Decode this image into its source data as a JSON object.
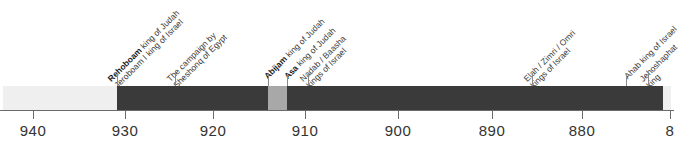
{
  "chart_data": {
    "type": "bar",
    "title": "",
    "subtitle": "",
    "xlabel": "",
    "ylabel": "",
    "orientation": "horizontal",
    "axis": {
      "units": "BCE years",
      "direction": "descending",
      "xlim": [
        945,
        876
      ],
      "grid": false,
      "ticks": [
        {
          "label": "940",
          "value": 940,
          "x": 33
        },
        {
          "label": "930",
          "value": 930,
          "x": 125
        },
        {
          "label": "920",
          "value": 920,
          "x": 213
        },
        {
          "label": "910",
          "value": 910,
          "x": 305
        },
        {
          "label": "900",
          "value": 900,
          "x": 398
        },
        {
          "label": "890",
          "value": 890,
          "x": 492
        },
        {
          "label": "880",
          "value": 880,
          "x": 582
        },
        {
          "label": "8",
          "value": 870,
          "x": 670,
          "clipped": true
        }
      ]
    },
    "segments": [
      {
        "name": "segment-pre-rehoboam",
        "color": "#efefef",
        "x": 3,
        "width": 114
      },
      {
        "name": "segment-rehoboam",
        "color": "#3a3a3a",
        "x": 117,
        "width": 151
      },
      {
        "name": "segment-abijam",
        "color": "#a8a8a8",
        "x": 268,
        "width": 19
      },
      {
        "name": "segment-asa",
        "color": "#3a3a3a",
        "x": 287,
        "width": 376
      },
      {
        "name": "segment-post-asa",
        "color": "#efefef",
        "x": 663,
        "width": 8
      }
    ],
    "annotations": [
      {
        "name": "annotation-rehoboam",
        "x": 119,
        "lines": [
          {
            "ruler": "Rehoboam",
            "realm": " king of Judah",
            "bold": true
          },
          {
            "ruler": "",
            "realm": "Jeroboam I king of Israel",
            "bold": false
          }
        ]
      },
      {
        "name": "annotation-shoshenq-campaign",
        "x": 178,
        "lines": [
          {
            "ruler": "",
            "realm": "The campaign by",
            "bold": false
          },
          {
            "ruler": "",
            "realm": "Sheshonq of Egypt",
            "bold": false
          }
        ]
      },
      {
        "name": "annotation-abijam",
        "x": 269,
        "lines": [
          {
            "ruler": "Abijam",
            "realm": " king of Judah",
            "bold": true
          }
        ]
      },
      {
        "name": "annotation-asa",
        "x": 289,
        "lines": [
          {
            "ruler": "Asa",
            "realm": " king of Judah",
            "bold": true
          }
        ]
      },
      {
        "name": "annotation-nadab-baasha",
        "x": 311,
        "lines": [
          {
            "ruler": "",
            "realm": "Nadab / Baasha",
            "bold": false
          },
          {
            "ruler": "",
            "realm": "kings of Israel",
            "bold": false
          }
        ]
      },
      {
        "name": "annotation-elah-zimri-omri",
        "x": 535,
        "lines": [
          {
            "ruler": "",
            "realm": "Elah / Zimri / Omri",
            "bold": false
          },
          {
            "ruler": "",
            "realm": "kings of Israel",
            "bold": false
          }
        ]
      },
      {
        "name": "annotation-ahab",
        "x": 629,
        "lines": [
          {
            "ruler": "",
            "realm": "Ahab king of Israel",
            "bold": false
          }
        ]
      },
      {
        "name": "annotation-jehoshaphat",
        "x": 651,
        "lines": [
          {
            "ruler": "",
            "realm": "Jehoshaphat",
            "bold": false
          },
          {
            "ruler": "",
            "realm": "king",
            "bold": false
          }
        ]
      }
    ],
    "leaders": [
      {
        "name": "leader-rehoboam",
        "x": 117,
        "top": 73,
        "height": 13
      },
      {
        "name": "leader-shoshenq",
        "x": 175,
        "top": 73,
        "height": 13
      },
      {
        "name": "leader-abijam",
        "x": 268,
        "top": 73,
        "height": 13
      },
      {
        "name": "leader-asa",
        "x": 287,
        "top": 73,
        "height": 13
      },
      {
        "name": "leader-nadab-baasha",
        "x": 308,
        "top": 73,
        "height": 13
      },
      {
        "name": "leader-elah-zimri-omri",
        "x": 532,
        "top": 73,
        "height": 13
      },
      {
        "name": "leader-ahab",
        "x": 626,
        "top": 73,
        "height": 13
      },
      {
        "name": "leader-jehoshaphat",
        "x": 648,
        "top": 73,
        "height": 13
      }
    ],
    "colors": {
      "light_segment": "#efefef",
      "dark_segment": "#3a3a3a",
      "mid_segment": "#a8a8a8",
      "axis": "#6b6b6b",
      "text": "#333333"
    }
  }
}
